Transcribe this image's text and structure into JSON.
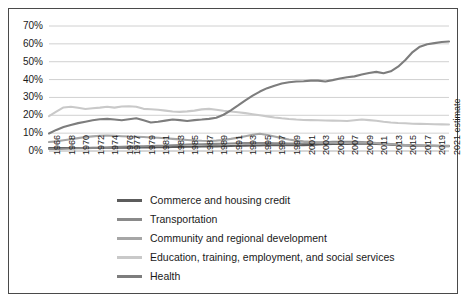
{
  "chart_data": {
    "type": "line",
    "title": "",
    "xlabel": "",
    "ylabel": "",
    "ylim": [
      0,
      70
    ],
    "yticks": [
      "0%",
      "10%",
      "20%",
      "30%",
      "40%",
      "50%",
      "60%",
      "70%"
    ],
    "grid": true,
    "legend_position": "bottom-left",
    "x": [
      "1966",
      "1967",
      "1968",
      "1969",
      "1970",
      "1971",
      "1972",
      "1973",
      "1974",
      "1975",
      "1976",
      "1977",
      "1978",
      "1979",
      "1980",
      "1981",
      "1982",
      "1983",
      "1984",
      "1985",
      "1986",
      "1987",
      "1988",
      "1989",
      "1990",
      "1991",
      "1992",
      "1993",
      "1994",
      "1995",
      "1996",
      "1997",
      "1998",
      "1999",
      "2000",
      "2001",
      "2002",
      "2003",
      "2004",
      "2005",
      "2006",
      "2007",
      "2008",
      "2009",
      "2010",
      "2011",
      "2012",
      "2013",
      "2014",
      "2015",
      "2016",
      "2017",
      "2018",
      "2019",
      "2020",
      "2021 estimate"
    ],
    "xticks": [
      "1966",
      "1968",
      "1970",
      "1972",
      "1974",
      "1976",
      "1977",
      "1979",
      "1981",
      "1983",
      "1985",
      "1987",
      "1989",
      "1991",
      "1993",
      "1995",
      "1997",
      "1999",
      "2001",
      "2003",
      "2005",
      "2007",
      "2009",
      "2011",
      "2013",
      "2015",
      "2017",
      "2019",
      "2021 estimate"
    ],
    "series": [
      {
        "name": "Commerce and housing credit",
        "color": "#5c5c5c",
        "values": [
          1.6,
          1.6,
          1.7,
          1.7,
          1.7,
          1.7,
          1.8,
          1.8,
          1.8,
          1.9,
          1.9,
          1.9,
          2.0,
          2.0,
          2.0,
          2.1,
          2.1,
          2.2,
          2.3,
          2.4,
          2.4,
          2.5,
          2.6,
          2.6,
          2.7,
          2.8,
          2.9,
          3.0,
          3.1,
          3.1,
          3.2,
          3.2,
          3.2,
          3.2,
          3.2,
          3.3,
          3.4,
          3.6,
          3.8,
          3.9,
          4.0,
          4.0,
          4.1,
          4.2,
          4.1,
          4.0,
          3.8,
          3.5,
          3.3,
          3.1,
          3.0,
          2.9,
          2.8,
          2.8,
          2.7,
          2.7
        ]
      },
      {
        "name": "Transportation",
        "color": "#8a8a8a",
        "values": [
          1.1,
          1.2,
          1.3,
          1.4,
          1.5,
          1.6,
          1.7,
          1.8,
          2.0,
          2.2,
          2.4,
          2.5,
          2.6,
          2.7,
          2.8,
          2.9,
          3.0,
          3.2,
          3.4,
          3.6,
          3.7,
          3.8,
          3.9,
          4.0,
          4.1,
          4.2,
          4.3,
          4.4,
          4.4,
          4.4,
          4.4,
          4.3,
          4.3,
          4.2,
          4.2,
          4.3,
          4.5,
          4.7,
          4.9,
          5.1,
          5.2,
          5.2,
          5.1,
          5.0,
          4.8,
          4.5,
          4.2,
          3.9,
          3.6,
          3.4,
          3.2,
          3.1,
          3.0,
          3.0,
          2.9,
          2.9
        ]
      },
      {
        "name": "Community and regional development",
        "color": "#a6a6a6",
        "values": [
          5.0,
          5.4,
          6.0,
          6.6,
          7.2,
          7.8,
          8.2,
          8.5,
          8.6,
          8.5,
          8.3,
          8.1,
          8.0,
          7.8,
          7.6,
          7.4,
          7.1,
          6.8,
          6.5,
          6.2,
          5.9,
          5.7,
          5.6,
          5.8,
          6.2,
          6.8,
          7.5,
          8.3,
          9.1,
          9.7,
          9.0,
          8.1,
          7.2,
          6.4,
          5.8,
          5.4,
          5.1,
          4.9,
          4.7,
          4.6,
          4.5,
          4.5,
          4.6,
          4.7,
          4.6,
          4.4,
          4.1,
          3.8,
          3.5,
          3.3,
          3.1,
          3.0,
          2.9,
          2.8,
          2.8,
          2.8
        ]
      },
      {
        "name": "Education, training, employment, and social services",
        "color": "#c9c9c9",
        "values": [
          19.5,
          22.0,
          24.4,
          24.8,
          24.2,
          23.5,
          23.9,
          24.3,
          24.8,
          24.3,
          24.9,
          25.1,
          24.8,
          23.6,
          23.4,
          23.1,
          22.6,
          22.1,
          21.9,
          22.2,
          22.6,
          23.3,
          23.6,
          23.1,
          22.5,
          22.1,
          21.7,
          21.2,
          20.6,
          20.0,
          19.4,
          18.8,
          18.3,
          17.9,
          17.6,
          17.4,
          17.3,
          17.2,
          17.1,
          17.0,
          16.9,
          16.8,
          17.2,
          17.6,
          17.3,
          16.9,
          16.4,
          16.0,
          15.7,
          15.5,
          15.3,
          15.2,
          15.1,
          15.0,
          14.9,
          14.8
        ]
      },
      {
        "name": "Health",
        "color": "#7d7d7d",
        "values": [
          9.8,
          11.8,
          13.4,
          14.6,
          15.6,
          16.4,
          17.2,
          17.8,
          18.0,
          17.6,
          17.2,
          17.8,
          18.3,
          17.2,
          16.0,
          16.4,
          17.0,
          17.6,
          17.3,
          16.8,
          17.3,
          17.6,
          18.0,
          18.6,
          20.3,
          22.8,
          25.5,
          28.4,
          31.0,
          33.3,
          35.2,
          36.6,
          37.8,
          38.5,
          38.9,
          39.1,
          39.4,
          39.4,
          38.9,
          39.7,
          40.6,
          41.3,
          41.8,
          42.8,
          43.7,
          44.3,
          43.5,
          44.6,
          47.2,
          51.0,
          55.4,
          58.4,
          59.8,
          60.4,
          61.0,
          61.3
        ]
      }
    ]
  },
  "legend": {
    "items": [
      {
        "label": "Commerce and housing credit"
      },
      {
        "label": "Transportation"
      },
      {
        "label": "Community and regional development"
      },
      {
        "label": "Education, training, employment, and social services"
      },
      {
        "label": "Health"
      }
    ]
  }
}
